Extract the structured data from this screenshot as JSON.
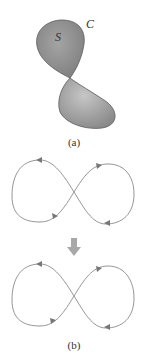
{
  "figure": {
    "part_a": {
      "caption": "(a)",
      "surface_label": "S",
      "curve_label": "C",
      "fill_color": "#8f8f8f",
      "stroke_color": "#5a5a5a"
    },
    "part_b": {
      "caption": "(b)",
      "curve_color": "#8a8a8a",
      "arrow_color": "#777777",
      "transform_arrow_color": "#a8a8a8",
      "transform_arrow": "down-arrow"
    }
  }
}
